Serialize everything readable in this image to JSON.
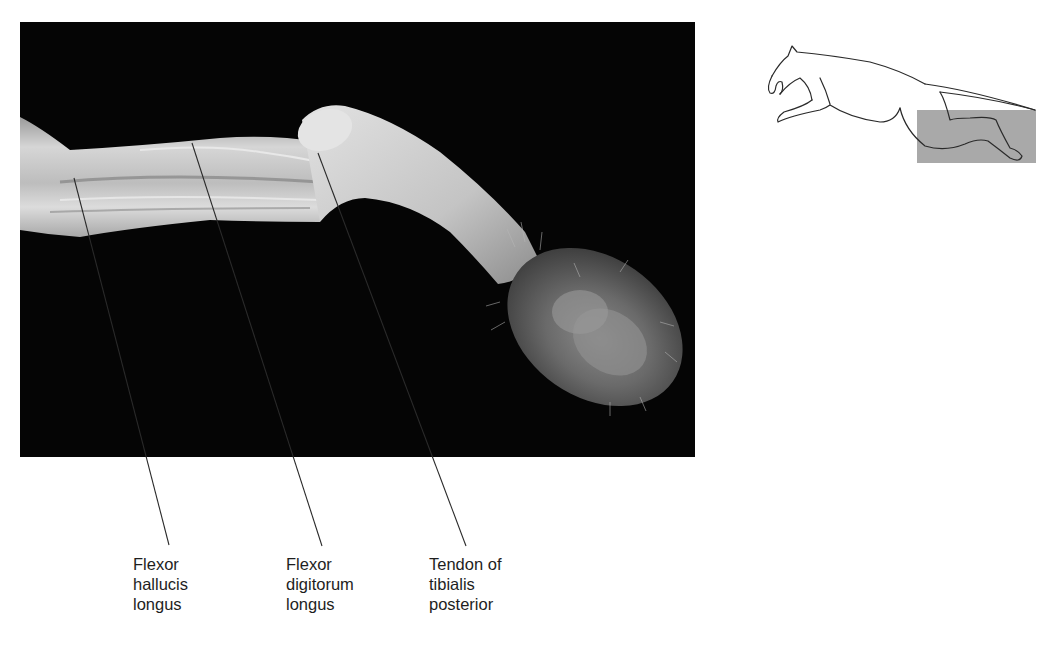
{
  "figure": {
    "photo_description": "Dissected cat hindlimb (lower leg and paw), medial view, on black background",
    "labels": [
      {
        "id": "flexor-hallucis-longus",
        "lines": [
          "Flexor",
          "hallucis",
          "longus"
        ]
      },
      {
        "id": "flexor-digitorum-longus",
        "lines": [
          "Flexor",
          "digitorum",
          "longus"
        ]
      },
      {
        "id": "tendon-tibialis-posterior",
        "lines": [
          "Tendon of",
          "tibialis",
          "posterior"
        ]
      }
    ],
    "locator": {
      "description": "Outline of leaping cat with shaded box highlighting hindlimb",
      "highlight_color": "#a9a9a9"
    }
  },
  "colors": {
    "background": "#ffffff",
    "photo_background": "#050505",
    "leader_line": "#2a2a2a",
    "text": "#1e1e1e"
  }
}
